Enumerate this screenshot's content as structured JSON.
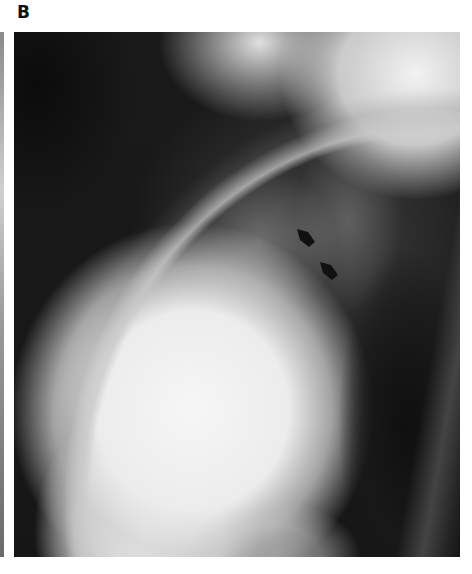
{
  "figure": {
    "panel_label": "B",
    "image": {
      "type": "lateral chest radiograph",
      "description": "Lateral chest X-ray showing a large bright cardiac/mediastinal silhouette in the lower anterior chest, dark aerated lung fields above and posterior, and two black arrowheads pointing to the posterior cardiac border."
    },
    "annotations": [
      {
        "name": "arrow-1",
        "shape": "arrowhead",
        "color": "#111111",
        "x": 297,
        "y": 230,
        "direction": "down-right"
      },
      {
        "name": "arrow-2",
        "shape": "arrowhead",
        "color": "#111111",
        "x": 320,
        "y": 262,
        "direction": "down-right"
      }
    ]
  }
}
